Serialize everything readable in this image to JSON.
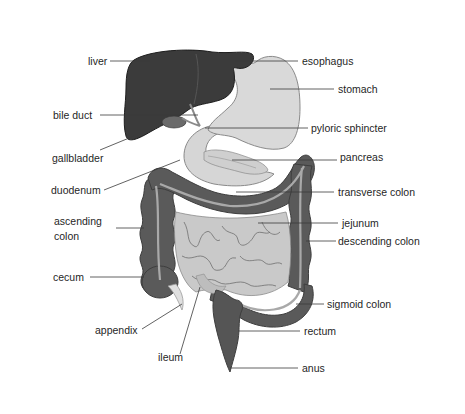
{
  "diagram": {
    "colors": {
      "background": "#ffffff",
      "liver": "#3b3b3b",
      "liver_edge": "#1e1e1e",
      "stomach": "#d9d9d9",
      "stomach_outline": "#8a8a8a",
      "colon": "#5a5a5a",
      "colon_band": "#a9a9a9",
      "small_intestine": "#c9c9c9",
      "small_intestine_lines": "#6e6e6e",
      "rectum": "#555555",
      "pancreas": "#cfcfcf",
      "appendix": "#e0e0e0",
      "text": "#1f1f1f",
      "leader": "#3a3a3a"
    },
    "labels": {
      "liver": "liver",
      "esophagus": "esophagus",
      "stomach": "stomach",
      "bile_duct": "bile duct",
      "pyloric_sphincter": "pyloric sphincter",
      "gallbladder": "gallbladder",
      "pancreas": "pancreas",
      "duodenum": "duodenum",
      "transverse_colon": "transverse colon",
      "ascending_colon_line1": "ascending",
      "ascending_colon_line2": "colon",
      "jejunum": "jejunum",
      "descending_colon": "descending colon",
      "cecum": "cecum",
      "sigmoid_colon": "sigmoid colon",
      "appendix": "appendix",
      "rectum": "rectum",
      "ileum": "ileum",
      "anus": "anus"
    }
  }
}
